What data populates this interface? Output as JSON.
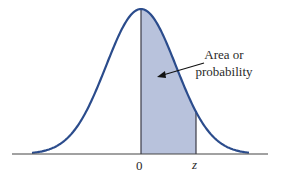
{
  "chart_data": {
    "type": "area",
    "title": "",
    "curve": {
      "distribution": "normal",
      "mean": 0,
      "sd": 1,
      "color": "#2b4c8c"
    },
    "shaded_region": {
      "from": "0",
      "to": "z",
      "fill": "#b8c2dc"
    },
    "tick_labels": [
      "0",
      "z"
    ],
    "annotation": {
      "lines": [
        "Area or",
        "probability"
      ],
      "arrow_to": "shaded_region"
    },
    "xlabel": "",
    "ylabel": "",
    "grid": false
  },
  "labels": {
    "zero": "0",
    "z": "z",
    "annotation_line1": "Area or",
    "annotation_line2": "probability"
  }
}
